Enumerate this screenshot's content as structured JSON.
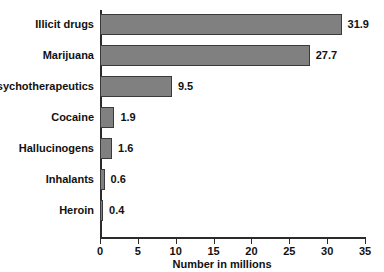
{
  "chart_data": {
    "type": "bar",
    "orientation": "horizontal",
    "title": "",
    "xlabel": "Number in millions",
    "ylabel": "",
    "categories": [
      "Illicit drugs",
      "Marijuana",
      "Psychotherapeutics",
      "Cocaine",
      "Hallucinogens",
      "Inhalants",
      "Heroin"
    ],
    "values": [
      31.9,
      27.7,
      9.5,
      1.9,
      1.6,
      0.6,
      0.4
    ],
    "value_labels": [
      "31.9",
      "27.7",
      "9.5",
      "1.9",
      "1.6",
      "0.6",
      "0.4"
    ],
    "xlim": [
      0,
      35
    ],
    "xticks": [
      0,
      5,
      10,
      15,
      20,
      25,
      30,
      35
    ],
    "xtick_labels": [
      "0",
      "5",
      "10",
      "15",
      "20",
      "25",
      "30",
      "35"
    ],
    "grid": false,
    "legend": null,
    "bar_color": "#808080",
    "bar_edge_color": "#3a3a3a",
    "axis_color": "#2b2b2b",
    "background": "#ffffff"
  }
}
